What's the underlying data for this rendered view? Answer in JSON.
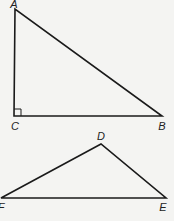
{
  "diagram": {
    "stroke_color": "#1a1a1a",
    "background": "#f4f4f2",
    "triangles": [
      {
        "name": "ABC",
        "right_angle_at": "C",
        "vertices": [
          {
            "label": "A",
            "x": 15,
            "y": 9,
            "label_x": 14,
            "label_y": 4
          },
          {
            "label": "C",
            "x": 14,
            "y": 116,
            "label_x": 15,
            "label_y": 126
          },
          {
            "label": "B",
            "x": 162,
            "y": 116,
            "label_x": 162,
            "label_y": 126
          }
        ]
      },
      {
        "name": "DEF",
        "vertices": [
          {
            "label": "D",
            "x": 101,
            "y": 144,
            "label_x": 101,
            "label_y": 136
          },
          {
            "label": "F",
            "x": 1,
            "y": 198,
            "label_x": 1,
            "label_y": 207
          },
          {
            "label": "E",
            "x": 166,
            "y": 198,
            "label_x": 163,
            "label_y": 207
          }
        ]
      }
    ]
  }
}
